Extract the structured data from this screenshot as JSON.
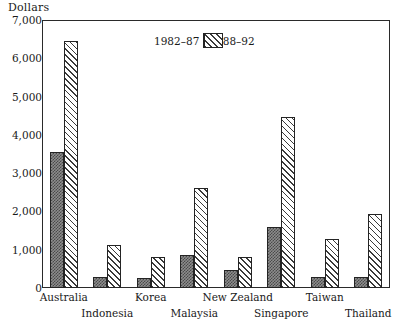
{
  "chart_data": {
    "type": "bar",
    "title": "",
    "ylabel": "Dollars",
    "xlabel": "",
    "ylim": [
      0,
      7000
    ],
    "ytick_values": [
      0,
      1000,
      2000,
      3000,
      4000,
      5000,
      6000,
      7000
    ],
    "ytick_labels": [
      "0",
      "1,000",
      "2,000",
      "3,000",
      "4,000",
      "5,000",
      "6,000",
      "7,000"
    ],
    "grid": false,
    "legend_position": "inside-top-center",
    "categories": [
      "Australia",
      "Indonesia",
      "Korea",
      "Malaysia",
      "New Zealand",
      "Singapore",
      "Taiwan",
      "Thailand"
    ],
    "series": [
      {
        "name": "1982–87",
        "pattern": "dark-checker",
        "values": [
          3550,
          280,
          270,
          860,
          470,
          1600,
          280,
          280
        ]
      },
      {
        "name": "1988–92",
        "pattern": "diagonal-hatch",
        "values": [
          6450,
          1120,
          800,
          2600,
          820,
          4470,
          1290,
          1930
        ]
      }
    ]
  },
  "axis": {
    "y_title": "Dollars"
  },
  "legend": {
    "left_label": "1982–87",
    "right_label": "1988–92"
  },
  "colors": {
    "frame": "#2a2a2a",
    "series_a": "#4a4a4a",
    "series_b": "#3a3a3a",
    "background": "#ffffff"
  }
}
